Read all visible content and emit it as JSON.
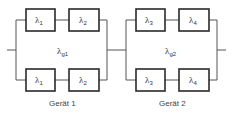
{
  "diagram": {
    "type": "reliability-block-diagram",
    "devices": [
      {
        "caption": "Gerät 1",
        "total_rate": {
          "symbol": "λ",
          "sub": "g1"
        },
        "branches": [
          [
            {
              "symbol": "λ",
              "sub": "1"
            },
            {
              "symbol": "λ",
              "sub": "2"
            }
          ],
          [
            {
              "symbol": "λ",
              "sub": "1"
            },
            {
              "symbol": "λ",
              "sub": "2"
            }
          ]
        ]
      },
      {
        "caption": "Gerät 2",
        "total_rate": {
          "symbol": "λ",
          "sub": "g2"
        },
        "branches": [
          [
            {
              "symbol": "λ",
              "sub": "3"
            },
            {
              "symbol": "λ",
              "sub": "4"
            }
          ],
          [
            {
              "symbol": "λ",
              "sub": "3"
            },
            {
              "symbol": "λ",
              "sub": "4"
            }
          ]
        ]
      }
    ],
    "colors": {
      "line": "#555555",
      "box_border": "#2a2a2a",
      "text": "#333333"
    }
  }
}
